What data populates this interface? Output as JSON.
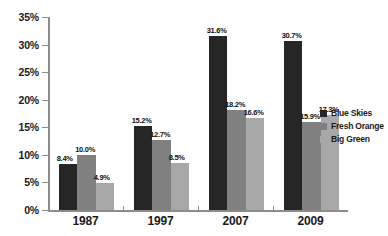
{
  "chart_data": {
    "type": "bar",
    "title": "",
    "subtitle": "",
    "xlabel": "",
    "ylabel": "",
    "categories": [
      "1987",
      "1997",
      "2007",
      "2009"
    ],
    "series": [
      {
        "name": "Blue Skies",
        "color": "#262626",
        "values": [
          8.4,
          15.2,
          31.6,
          30.7
        ],
        "labels": [
          "8.4%",
          "15.2%",
          "31.6%",
          "30.7%"
        ]
      },
      {
        "name": "Fresh Orange",
        "color": "#808080",
        "values": [
          10.0,
          12.7,
          18.2,
          15.9
        ],
        "labels": [
          "10.0%",
          "12.7%",
          "18.2%",
          "15.9%"
        ]
      },
      {
        "name": "Big Green",
        "color": "#a8a8a8",
        "values": [
          4.9,
          8.5,
          16.6,
          17.3
        ],
        "labels": [
          "4.9%",
          "8.5%",
          "16.6%",
          "17.3%"
        ]
      }
    ],
    "ylim": [
      0,
      35
    ],
    "y_ticks": [
      0,
      5,
      10,
      15,
      20,
      25,
      30,
      35
    ],
    "y_tick_labels": [
      "0%",
      "5%",
      "10%",
      "15%",
      "20%",
      "25%",
      "30%",
      "35%"
    ],
    "grid": false,
    "legend_position": "right",
    "axis_color": "#8c8c8c",
    "background": "#ffffff"
  }
}
